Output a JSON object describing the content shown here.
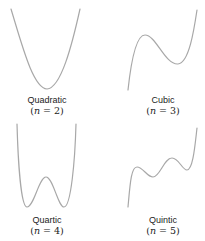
{
  "panels": [
    {
      "name": "Quadratic",
      "equation": "n = 2",
      "n_var": "n",
      "n_value": "2"
    },
    {
      "name": "Cubic",
      "equation": "n = 3",
      "n_var": "n",
      "n_value": "3"
    },
    {
      "name": "Quartic",
      "equation": "n = 4",
      "n_var": "n",
      "n_value": "4"
    },
    {
      "name": "Quintic",
      "equation": "n = 5",
      "n_var": "n",
      "n_value": "5"
    }
  ],
  "style": {
    "curve_color": "#a8a8a8",
    "text_color": "#222222"
  }
}
